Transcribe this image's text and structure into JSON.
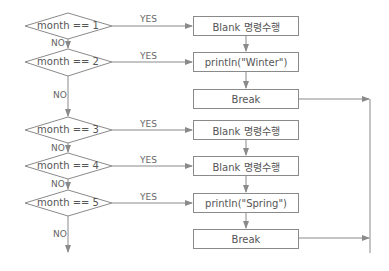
{
  "diagram": {
    "type": "flowchart",
    "colors": {
      "line": "#8a8a8a",
      "text": "#555555",
      "background": "#ffffff"
    },
    "decisions": [
      {
        "id": "d1",
        "label": "month == 1",
        "yes": "YES",
        "no": "NO"
      },
      {
        "id": "d2",
        "label": "month == 2",
        "yes": "YES",
        "no": "NO"
      },
      {
        "id": "d3",
        "label": "month == 3",
        "yes": "YES",
        "no": "NO"
      },
      {
        "id": "d4",
        "label": "month == 4",
        "yes": "YES",
        "no": "NO"
      },
      {
        "id": "d5",
        "label": "month == 5",
        "yes": "YES",
        "no": "NO"
      }
    ],
    "actions": [
      {
        "id": "a1",
        "label": "Blank 명령수행"
      },
      {
        "id": "a2",
        "label": "println(\"Winter\")"
      },
      {
        "id": "b1",
        "label": "Break"
      },
      {
        "id": "a3",
        "label": "Blank 명령수행"
      },
      {
        "id": "a4",
        "label": "Blank 명령수행"
      },
      {
        "id": "a5",
        "label": "println(\"Spring\")"
      },
      {
        "id": "b2",
        "label": "Break"
      }
    ]
  }
}
